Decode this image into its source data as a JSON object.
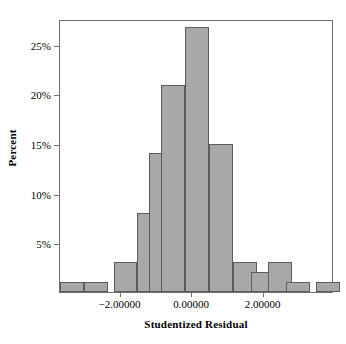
{
  "chart_data": {
    "type": "bar",
    "title": "",
    "subtitle": "",
    "xlabel": "Studentized Residual",
    "ylabel": "Percent",
    "grid": false,
    "legend": "none",
    "xlim": [
      -3.667,
      4.0
    ],
    "ylim": [
      0,
      27.5
    ],
    "xticks": [
      -2.0,
      0.0,
      2.0
    ],
    "xtick_labels": [
      "-2.00000",
      "0.00000",
      "2.00000"
    ],
    "yticks": [
      5,
      10,
      15,
      20,
      25
    ],
    "ytick_labels": [
      "5%",
      "10%",
      "15%",
      "20%",
      "25%"
    ],
    "bin_width": 0.6667,
    "bin_centers": [
      -3.333,
      -2.667,
      -1.667,
      -1.333,
      -0.667,
      -0.333,
      0.333,
      0.667,
      1.333,
      1.667,
      2.0,
      2.667,
      3.667
    ],
    "bins": [
      {
        "center": -3.333,
        "left": -3.667,
        "right": -3.0,
        "percent": 1.0
      },
      {
        "center": -2.667,
        "left": -3.0,
        "right": -2.333,
        "percent": 1.0
      },
      {
        "center": -1.833,
        "left": -2.167,
        "right": -1.5,
        "percent": 3.0
      },
      {
        "center": -1.167,
        "left": -1.5,
        "right": -0.833,
        "percent": 8.0
      },
      {
        "center": -0.833,
        "left": -1.167,
        "right": -0.5,
        "percent": 14.0
      },
      {
        "center": -0.5,
        "left": -0.833,
        "right": -0.167,
        "percent": 20.9
      },
      {
        "center": 0.167,
        "left": -0.167,
        "right": 0.5,
        "percent": 26.7
      },
      {
        "center": 0.833,
        "left": 0.5,
        "right": 1.167,
        "percent": 14.9
      },
      {
        "center": 1.5,
        "left": 1.167,
        "right": 1.833,
        "percent": 3.0
      },
      {
        "center": 2.0,
        "left": 1.667,
        "right": 2.333,
        "percent": 2.0
      },
      {
        "center": 2.5,
        "left": 2.167,
        "right": 2.833,
        "percent": 3.0
      },
      {
        "center": 3.0,
        "left": 2.667,
        "right": 3.333,
        "percent": 1.0
      },
      {
        "center": 3.833,
        "left": 3.5,
        "right": 4.167,
        "percent": 1.0
      }
    ],
    "values": [
      1.0,
      1.0,
      3.0,
      8.0,
      14.0,
      20.9,
      26.7,
      14.9,
      3.0,
      2.0,
      3.0,
      1.0,
      1.0
    ],
    "bar_color": "#a8a8a8",
    "bar_edge_color": "#5c5c5c",
    "axis_color": "#6f6f6f"
  },
  "axes": {
    "y": {
      "title": "Percent",
      "ticks": [
        {
          "label": "25%",
          "value": 25
        },
        {
          "label": "20%",
          "value": 20
        },
        {
          "label": "15%",
          "value": 15
        },
        {
          "label": "10%",
          "value": 10
        },
        {
          "label": "5%",
          "value": 5
        }
      ]
    },
    "x": {
      "title": "Studentized Residual",
      "ticks": [
        {
          "label": "-2.00000",
          "value": -2.0
        },
        {
          "label": "0.00000",
          "value": 0.0
        },
        {
          "label": "2.00000",
          "value": 2.0
        }
      ]
    }
  }
}
